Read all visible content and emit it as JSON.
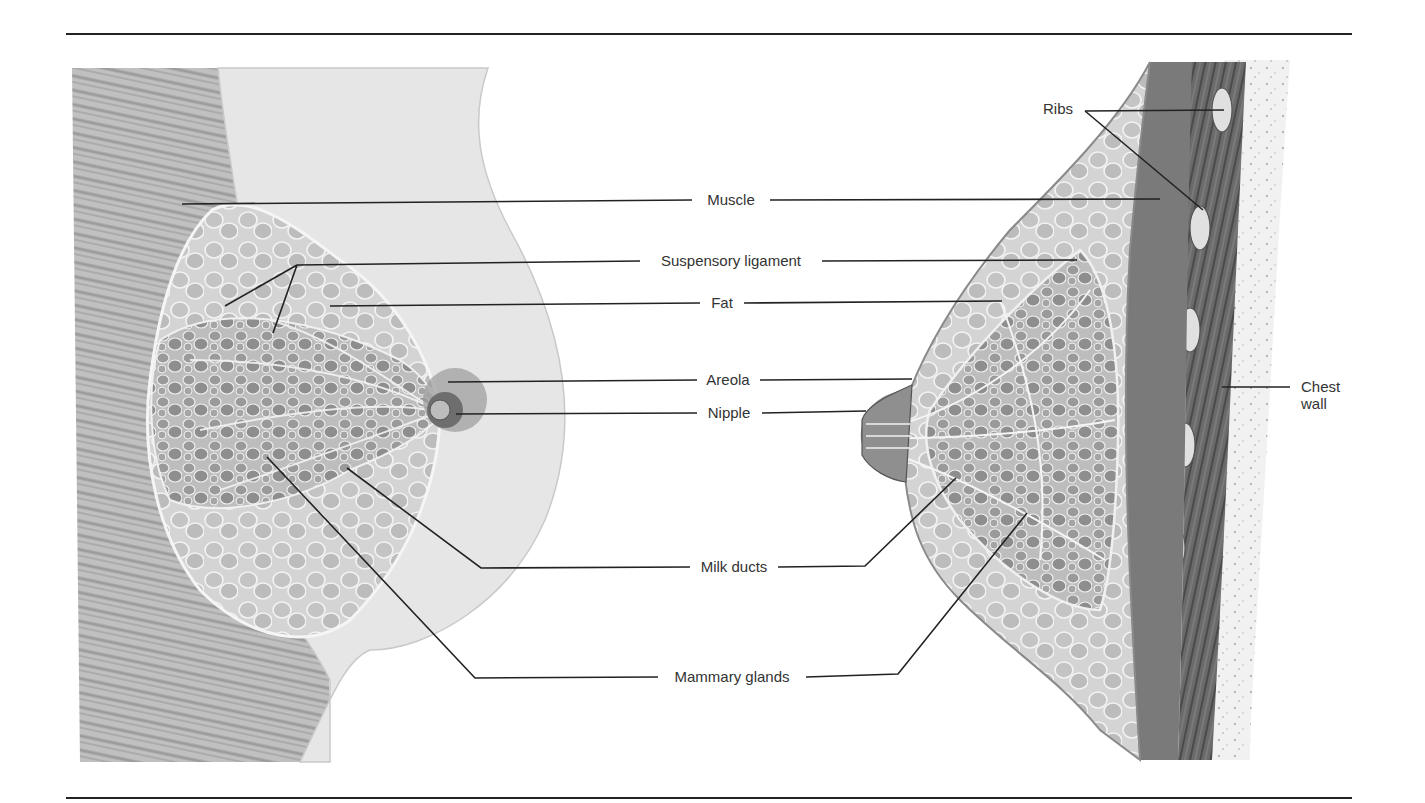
{
  "figure": {
    "colors": {
      "line": "#222222",
      "tissue_light": "#d9d9d9",
      "tissue_mid": "#a8a8a8",
      "tissue_dark": "#5e5e5e",
      "muscle": "#8a8a8a",
      "background": "#ffffff"
    },
    "rules": {
      "top_y": 34,
      "bottom_y": 798,
      "x_start": 66,
      "x_end": 1352
    }
  },
  "labels": {
    "muscle": "Muscle",
    "suspensory_ligament": "Suspensory ligament",
    "fat": "Fat",
    "areola": "Areola",
    "nipple": "Nipple",
    "milk_ducts": "Milk ducts",
    "mammary_glands": "Mammary glands",
    "ribs": "Ribs",
    "chest_wall_line1": "Chest",
    "chest_wall_line2": "wall"
  },
  "views": {
    "left": "Frontal cutaway view of breast",
    "right": "Sagittal cross-section of breast on chest wall"
  }
}
